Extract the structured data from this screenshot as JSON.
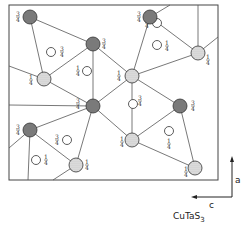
{
  "diagram": {
    "title": "CuTaS",
    "title_subscript": "3",
    "axes": {
      "vertical_label": "a",
      "horizontal_label": "c"
    },
    "frame": {
      "x": 9,
      "y": 5,
      "width": 209,
      "height": 175
    },
    "colors": {
      "dark_atom": "#7a7a7a",
      "dotted_atom": "#d8d8d8",
      "open_atom": "#ffffff",
      "line": "#555555"
    },
    "atoms": [
      {
        "id": "A",
        "type": "dark",
        "x": 30,
        "y": 17,
        "label": "3/4",
        "lx": 18,
        "ly": 17
      },
      {
        "id": "B",
        "type": "dark",
        "x": 93,
        "y": 44,
        "label": "3/4",
        "lx": 104,
        "ly": 44
      },
      {
        "id": "C",
        "type": "dotted",
        "x": 44,
        "y": 79,
        "label": "1/4",
        "lx": 31,
        "ly": 80
      },
      {
        "id": "D",
        "type": "dark",
        "x": 93,
        "y": 106,
        "label": "3/4",
        "lx": 78,
        "ly": 104
      },
      {
        "id": "E",
        "type": "dotted",
        "x": 132,
        "y": 76,
        "label": "1/4",
        "lx": 119,
        "ly": 76
      },
      {
        "id": "F",
        "type": "dark",
        "x": 150,
        "y": 17,
        "label": "3/4",
        "lx": 139,
        "ly": 17
      },
      {
        "id": "G",
        "type": "dotted",
        "x": 198,
        "y": 53,
        "label": "1/4",
        "lx": 208,
        "ly": 60
      },
      {
        "id": "H",
        "type": "dark",
        "x": 180,
        "y": 106,
        "label": "3/4",
        "lx": 193,
        "ly": 106
      },
      {
        "id": "I",
        "type": "dotted",
        "x": 132,
        "y": 140,
        "label": "1/4",
        "lx": 122,
        "ly": 142
      },
      {
        "id": "J",
        "type": "dark",
        "x": 30,
        "y": 130,
        "label": "3/4",
        "lx": 18,
        "ly": 130
      },
      {
        "id": "K",
        "type": "dotted",
        "x": 76,
        "y": 165,
        "label": "1/4",
        "lx": 87,
        "ly": 165
      },
      {
        "id": "L",
        "type": "dotted",
        "x": 195,
        "y": 168,
        "label": "1/4",
        "lx": 186,
        "ly": 172
      }
    ],
    "open_atoms": [
      {
        "x": 51,
        "y": 52,
        "label": "3/4",
        "lx": 62,
        "ly": 52
      },
      {
        "x": 87,
        "y": 71,
        "label": "1/4",
        "lx": 78,
        "ly": 71
      },
      {
        "x": 157,
        "y": 23,
        "label": "3/4",
        "lx": 147,
        "ly": 23
      },
      {
        "x": 157,
        "y": 45,
        "label": "1/4",
        "lx": 167,
        "ly": 46
      },
      {
        "x": 133,
        "y": 104,
        "label": "3/4",
        "lx": 140,
        "ly": 101
      },
      {
        "x": 169,
        "y": 131,
        "label": "1/4",
        "lx": 169,
        "ly": 144
      },
      {
        "x": 67,
        "y": 140,
        "label": "3/4",
        "lx": 57,
        "ly": 140
      },
      {
        "x": 36,
        "y": 160,
        "label": "1/4",
        "lx": 46,
        "ly": 160
      }
    ],
    "bonds": [
      [
        30,
        17,
        93,
        44
      ],
      [
        30,
        17,
        44,
        79
      ],
      [
        93,
        44,
        44,
        79
      ],
      [
        93,
        44,
        93,
        106
      ],
      [
        93,
        44,
        132,
        76
      ],
      [
        44,
        79,
        93,
        106
      ],
      [
        93,
        106,
        132,
        76
      ],
      [
        132,
        76,
        150,
        17
      ],
      [
        132,
        76,
        198,
        53
      ],
      [
        132,
        76,
        132,
        140
      ],
      [
        150,
        17,
        198,
        53
      ],
      [
        150,
        17,
        170,
        5
      ],
      [
        198,
        53,
        198,
        5
      ],
      [
        198,
        53,
        218,
        37
      ],
      [
        93,
        106,
        30,
        130
      ],
      [
        93,
        106,
        76,
        165
      ],
      [
        93,
        106,
        132,
        140
      ],
      [
        132,
        140,
        180,
        106
      ],
      [
        132,
        140,
        195,
        168
      ],
      [
        180,
        106,
        195,
        168
      ],
      [
        180,
        106,
        132,
        76
      ],
      [
        30,
        130,
        9,
        148
      ],
      [
        30,
        130,
        28,
        180
      ],
      [
        30,
        130,
        76,
        165
      ],
      [
        76,
        165,
        53,
        180
      ],
      [
        93,
        106,
        9,
        105
      ],
      [
        44,
        79,
        9,
        66
      ]
    ]
  }
}
